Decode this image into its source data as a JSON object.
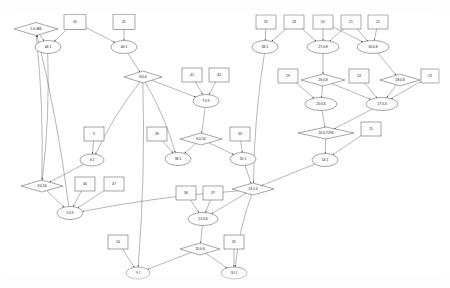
{
  "diagram": {
    "style": {
      "background": "#ffffff",
      "node_fill": "#fdfdfd",
      "node_stroke": "#3a3a3a",
      "edge_color": "#4a4a4a"
    },
    "nodes": [
      {
        "id": "n1",
        "label": "1:0.486",
        "shape": "diamond",
        "x": 36,
        "y": 29,
        "w": 44,
        "h": 13
      },
      {
        "id": "n45",
        "label": "45",
        "shape": "rect",
        "x": 75,
        "y": 22,
        "w": 22,
        "h": 15
      },
      {
        "id": "n41t",
        "label": "41",
        "shape": "rect",
        "x": 124,
        "y": 22,
        "w": 22,
        "h": 15
      },
      {
        "id": "n44",
        "label": "44:1",
        "shape": "ellipse",
        "x": 48,
        "y": 47,
        "w": 26,
        "h": 13
      },
      {
        "id": "n40",
        "label": "40:1",
        "shape": "ellipse",
        "x": 124,
        "y": 47,
        "w": 26,
        "h": 13
      },
      {
        "id": "n8",
        "label": "8:0.6",
        "shape": "diamond",
        "x": 143,
        "y": 77,
        "w": 38,
        "h": 12
      },
      {
        "id": "n41b",
        "label": "41",
        "shape": "rect",
        "x": 192,
        "y": 75,
        "w": 20,
        "h": 14
      },
      {
        "id": "n42",
        "label": "42",
        "shape": "rect",
        "x": 219,
        "y": 75,
        "w": 20,
        "h": 14
      },
      {
        "id": "n7",
        "label": "7:0.9",
        "shape": "ellipse",
        "x": 206,
        "y": 101,
        "w": 26,
        "h": 13
      },
      {
        "id": "n5",
        "label": "5",
        "shape": "rect",
        "x": 94,
        "y": 134,
        "w": 20,
        "h": 14
      },
      {
        "id": "n39",
        "label": "39",
        "shape": "rect",
        "x": 157,
        "y": 134,
        "w": 20,
        "h": 14
      },
      {
        "id": "n6",
        "label": "6:0.54",
        "shape": "diamond",
        "x": 201,
        "y": 139,
        "w": 42,
        "h": 12
      },
      {
        "id": "n33",
        "label": "33",
        "shape": "rect",
        "x": 240,
        "y": 134,
        "w": 20,
        "h": 14
      },
      {
        "id": "n4",
        "label": "4:1",
        "shape": "ellipse",
        "x": 92,
        "y": 160,
        "w": 24,
        "h": 12
      },
      {
        "id": "n38",
        "label": "38:1",
        "shape": "ellipse",
        "x": 178,
        "y": 159,
        "w": 26,
        "h": 13
      },
      {
        "id": "n32",
        "label": "32:1",
        "shape": "ellipse",
        "x": 243,
        "y": 159,
        "w": 26,
        "h": 13
      },
      {
        "id": "n3",
        "label": "3:0.54",
        "shape": "diamond",
        "x": 42,
        "y": 186,
        "w": 42,
        "h": 12
      },
      {
        "id": "n46",
        "label": "46",
        "shape": "rect",
        "x": 85,
        "y": 184,
        "w": 20,
        "h": 14
      },
      {
        "id": "n47",
        "label": "47",
        "shape": "rect",
        "x": 114,
        "y": 184,
        "w": 20,
        "h": 14
      },
      {
        "id": "n2",
        "label": "2:0.9",
        "shape": "ellipse",
        "x": 70,
        "y": 213,
        "w": 26,
        "h": 13
      },
      {
        "id": "n13",
        "label": "13:1.0",
        "shape": "diamond",
        "x": 253,
        "y": 189,
        "w": 42,
        "h": 12
      },
      {
        "id": "n36",
        "label": "36",
        "shape": "rect",
        "x": 186,
        "y": 193,
        "w": 20,
        "h": 14
      },
      {
        "id": "n37",
        "label": "37",
        "shape": "rect",
        "x": 213,
        "y": 193,
        "w": 20,
        "h": 14
      },
      {
        "id": "n12",
        "label": "12:0.6",
        "shape": "ellipse",
        "x": 203,
        "y": 219,
        "w": 30,
        "h": 13
      },
      {
        "id": "n10",
        "label": "10",
        "shape": "rect",
        "x": 118,
        "y": 242,
        "w": 20,
        "h": 14
      },
      {
        "id": "n11",
        "label": "11:0.6",
        "shape": "diamond",
        "x": 200,
        "y": 249,
        "w": 40,
        "h": 12
      },
      {
        "id": "n31",
        "label": "31",
        "shape": "rect",
        "x": 234,
        "y": 242,
        "w": 20,
        "h": 14
      },
      {
        "id": "n9",
        "label": "9:1",
        "shape": "ellipse",
        "x": 138,
        "y": 273,
        "w": 24,
        "h": 12
      },
      {
        "id": "n30",
        "label": "30:1",
        "shape": "ellipse",
        "x": 234,
        "y": 273,
        "w": 26,
        "h": 12
      },
      {
        "id": "n35",
        "label": "35",
        "shape": "rect",
        "x": 266,
        "y": 22,
        "w": 20,
        "h": 14
      },
      {
        "id": "n28",
        "label": "28",
        "shape": "rect",
        "x": 294,
        "y": 22,
        "w": 20,
        "h": 14
      },
      {
        "id": "n20",
        "label": "20",
        "shape": "rect",
        "x": 323,
        "y": 22,
        "w": 20,
        "h": 14
      },
      {
        "id": "n21",
        "label": "21",
        "shape": "rect",
        "x": 351,
        "y": 22,
        "w": 20,
        "h": 14
      },
      {
        "id": "n22",
        "label": "22",
        "shape": "rect",
        "x": 378,
        "y": 22,
        "w": 20,
        "h": 14
      },
      {
        "id": "n34",
        "label": "34:1",
        "shape": "ellipse",
        "x": 265,
        "y": 47,
        "w": 26,
        "h": 13
      },
      {
        "id": "n27",
        "label": "27:0.8",
        "shape": "ellipse",
        "x": 323,
        "y": 47,
        "w": 32,
        "h": 13
      },
      {
        "id": "n30b",
        "label": "30:0.8",
        "shape": "ellipse",
        "x": 373,
        "y": 47,
        "w": 32,
        "h": 13
      },
      {
        "id": "n29",
        "label": "29",
        "shape": "rect",
        "x": 288,
        "y": 76,
        "w": 20,
        "h": 14
      },
      {
        "id": "n26",
        "label": "26:0.8",
        "shape": "diamond",
        "x": 323,
        "y": 80,
        "w": 44,
        "h": 12
      },
      {
        "id": "n24",
        "label": "24",
        "shape": "rect",
        "x": 359,
        "y": 76,
        "w": 20,
        "h": 14
      },
      {
        "id": "n18",
        "label": "18:0.8",
        "shape": "diamond",
        "x": 400,
        "y": 80,
        "w": 40,
        "h": 12
      },
      {
        "id": "n23",
        "label": "23",
        "shape": "rect",
        "x": 430,
        "y": 76,
        "w": 18,
        "h": 14
      },
      {
        "id": "n25",
        "label": "25:0.6",
        "shape": "ellipse",
        "x": 321,
        "y": 104,
        "w": 32,
        "h": 13
      },
      {
        "id": "n17",
        "label": "17:0.4",
        "shape": "ellipse",
        "x": 382,
        "y": 104,
        "w": 32,
        "h": 13
      },
      {
        "id": "n16",
        "label": "16:0.7296",
        "shape": "diamond",
        "x": 326,
        "y": 133,
        "w": 56,
        "h": 12
      },
      {
        "id": "n15",
        "label": "15",
        "shape": "rect",
        "x": 371,
        "y": 129,
        "w": 20,
        "h": 14
      },
      {
        "id": "n14",
        "label": "14:1",
        "shape": "ellipse",
        "x": 325,
        "y": 160,
        "w": 26,
        "h": 13
      }
    ],
    "edges": [
      {
        "from": "n1",
        "to": "n44"
      },
      {
        "from": "n45",
        "to": "n44"
      },
      {
        "from": "n45",
        "to": "n40"
      },
      {
        "from": "n41t",
        "to": "n40"
      },
      {
        "from": "n40",
        "to": "n8"
      },
      {
        "from": "n8",
        "to": "n7"
      },
      {
        "from": "n41b",
        "to": "n7"
      },
      {
        "from": "n42",
        "to": "n7"
      },
      {
        "from": "n7",
        "to": "n6"
      },
      {
        "from": "n5",
        "to": "n4"
      },
      {
        "from": "n39",
        "to": "n38"
      },
      {
        "from": "n6",
        "to": "n38"
      },
      {
        "from": "n6",
        "to": "n32"
      },
      {
        "from": "n33",
        "to": "n32"
      },
      {
        "from": "n4",
        "to": "n3"
      },
      {
        "from": "n3",
        "to": "n2"
      },
      {
        "from": "n46",
        "to": "n2"
      },
      {
        "from": "n47",
        "to": "n2"
      },
      {
        "from": "n2",
        "to": "n1"
      },
      {
        "from": "n32",
        "to": "n13"
      },
      {
        "from": "n14",
        "to": "n13"
      },
      {
        "from": "n36",
        "to": "n12"
      },
      {
        "from": "n37",
        "to": "n12"
      },
      {
        "from": "n13",
        "to": "n12"
      },
      {
        "from": "n12",
        "to": "n11"
      },
      {
        "from": "n10",
        "to": "n9"
      },
      {
        "from": "n11",
        "to": "n9"
      },
      {
        "from": "n31",
        "to": "n30"
      },
      {
        "from": "n13",
        "to": "n30"
      },
      {
        "from": "n11",
        "to": "n30"
      },
      {
        "from": "n35",
        "to": "n34"
      },
      {
        "from": "n28",
        "to": "n34"
      },
      {
        "from": "n20",
        "to": "n27"
      },
      {
        "from": "n28",
        "to": "n27"
      },
      {
        "from": "n21",
        "to": "n27"
      },
      {
        "from": "n20",
        "to": "n30b"
      },
      {
        "from": "n21",
        "to": "n30b"
      },
      {
        "from": "n22",
        "to": "n30b"
      },
      {
        "from": "n27",
        "to": "n26"
      },
      {
        "from": "n30b",
        "to": "n18"
      },
      {
        "from": "n26",
        "to": "n25"
      },
      {
        "from": "n29",
        "to": "n25"
      },
      {
        "from": "n26",
        "to": "n17"
      },
      {
        "from": "n24",
        "to": "n17"
      },
      {
        "from": "n18",
        "to": "n17"
      },
      {
        "from": "n23",
        "to": "n17"
      },
      {
        "from": "n25",
        "to": "n16"
      },
      {
        "from": "n17",
        "to": "n16"
      },
      {
        "from": "n16",
        "to": "n14"
      },
      {
        "from": "n15",
        "to": "n14"
      },
      {
        "from": "n34",
        "to": "n13"
      },
      {
        "from": "n8",
        "to": "n38"
      },
      {
        "from": "n8",
        "to": "n4"
      },
      {
        "from": "n8",
        "to": "n9"
      },
      {
        "from": "n3",
        "to": "n1"
      },
      {
        "from": "n44",
        "to": "n3"
      },
      {
        "from": "n13",
        "to": "n2"
      }
    ]
  }
}
